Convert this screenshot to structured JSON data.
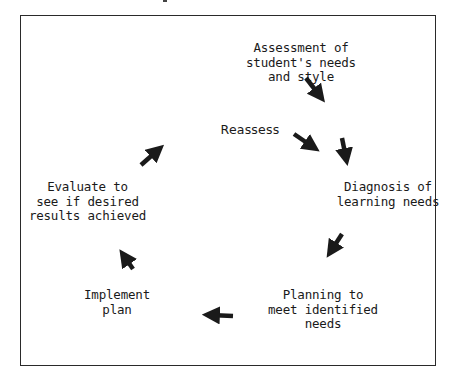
{
  "diagram": {
    "type": "cycle",
    "nodes": [
      {
        "id": "assessment",
        "text": "Assessment of\nstudent's needs\nand style"
      },
      {
        "id": "reassess",
        "text": "Reassess"
      },
      {
        "id": "diagnosis",
        "text": "Diagnosis of\nlearning needs"
      },
      {
        "id": "planning",
        "text": "Planning to\nmeet identified\nneeds"
      },
      {
        "id": "implement",
        "text": "Implement\nplan"
      },
      {
        "id": "evaluate",
        "text": "Evaluate to\nsee if desired\nresults achieved"
      }
    ],
    "edges": [
      {
        "from": "assessment",
        "to": "diagnosis"
      },
      {
        "from": "reassess",
        "to": "diagnosis"
      },
      {
        "from": "diagnosis",
        "to": "planning"
      },
      {
        "from": "planning",
        "to": "implement"
      },
      {
        "from": "implement",
        "to": "evaluate"
      },
      {
        "from": "evaluate",
        "to": "reassess"
      }
    ],
    "arrow_color": "#1a1a1a",
    "border_color": "#2a2a2a"
  }
}
